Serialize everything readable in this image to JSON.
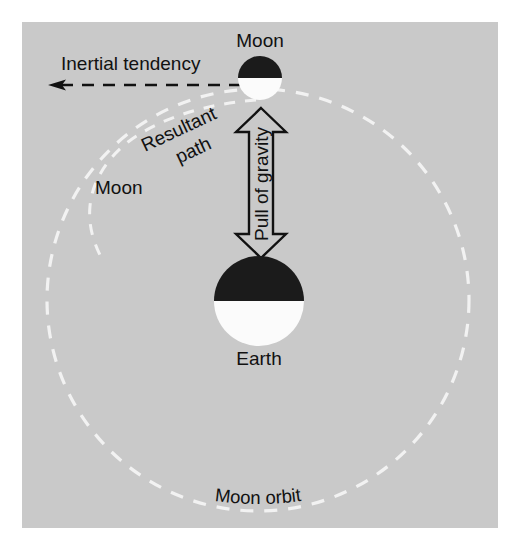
{
  "figure": {
    "panel_background": "#c9c9c9",
    "page_background": "#ffffff",
    "orbit_stroke": "#f2f2f2",
    "path_stroke": "#f2f2f2",
    "ink": "#111111",
    "body_dark": "#1b1b1b",
    "body_light": "#fbfbfb"
  },
  "labels": {
    "moon_top": "Moon",
    "moon_left": "Moon",
    "earth": "Earth",
    "inertial_tendency": "Inertial tendency",
    "resultant_path_line1": "Resultant",
    "resultant_path_line2": "path",
    "pull_of_gravity": "Pull of gravity",
    "moon_orbit": "Moon orbit"
  },
  "moon_orbit_curved": {
    "chars": [
      "M",
      "o",
      "o",
      "n",
      " ",
      "o",
      "r",
      "b",
      "i",
      "t"
    ]
  },
  "bodies": {
    "moon": {
      "name": "Moon",
      "cx": 260,
      "cy": 78,
      "r": 22,
      "top_half": "#1b1b1b",
      "bottom_half": "#fbfbfb"
    },
    "earth": {
      "name": "Earth",
      "cx": 259,
      "cy": 301,
      "r": 45,
      "top_half": "#1b1b1b",
      "bottom_half": "#fbfbfb"
    }
  },
  "geometry": {
    "panel": {
      "x": 22,
      "y": 22,
      "width": 476,
      "height": 506
    },
    "orbit": {
      "cx": 258,
      "cy": 300,
      "r": 211
    },
    "inertial_arrow": {
      "x_start": 262,
      "x_end": 48,
      "y": 85
    },
    "gravity_arrow": {
      "x": 261,
      "y_top": 108,
      "y_bottom": 258
    }
  }
}
